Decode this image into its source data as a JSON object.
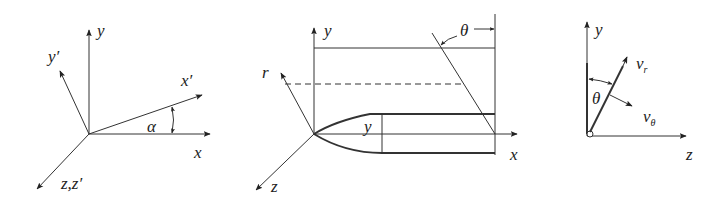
{
  "panels": [
    {
      "id": "rotated-axes",
      "labels": {
        "y": "y",
        "y_prime": "y′",
        "x_prime": "x′",
        "x": "x",
        "alpha": "α",
        "z": "z,z′"
      }
    },
    {
      "id": "cone-cylinder",
      "labels": {
        "y": "y",
        "r": "r",
        "theta": "θ",
        "inner_y": "y",
        "x": "x",
        "z": "z"
      }
    },
    {
      "id": "velocity-components",
      "labels": {
        "y": "y",
        "v_r": "v",
        "v_r_sub": "r",
        "theta": "θ",
        "v_theta": "v",
        "v_theta_sub": "θ",
        "z": "z"
      }
    }
  ],
  "colors": {
    "line": "#333333",
    "text": "#222222",
    "background": "#ffffff"
  }
}
